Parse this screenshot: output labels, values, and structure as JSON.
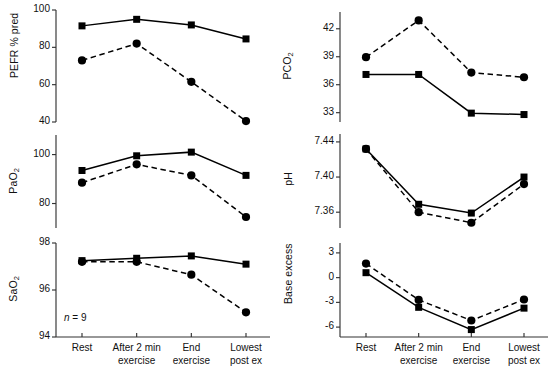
{
  "figure": {
    "annotation_n": "n = 9",
    "categories": [
      "Rest",
      "After 2 min exercise",
      "End exercise",
      "Lowest post ex"
    ],
    "category_lines": [
      [
        "Rest",
        ""
      ],
      [
        "After 2 min",
        "exercise"
      ],
      [
        "End",
        "exercise"
      ],
      [
        "Lowest",
        "post ex"
      ]
    ],
    "series_names": [
      "solid-square-series",
      "dashed-circle-series"
    ],
    "colors": {
      "ink": "#000000",
      "axis": "#333333",
      "background": "#ffffff"
    }
  },
  "chart_data": [
    {
      "type": "line",
      "title": "",
      "ylabel": "PEFR % pred",
      "xlabel": "",
      "categories": [
        "Rest",
        "After 2 min exercise",
        "End exercise",
        "Lowest post ex"
      ],
      "ylim": [
        40,
        100
      ],
      "yticks": [
        40,
        60,
        80,
        100
      ],
      "yticklabels": [
        "40",
        "60",
        "80",
        "100"
      ],
      "grid": false,
      "legend": "none",
      "series": [
        {
          "name": "solid-square-series",
          "style": "solid",
          "marker": "square",
          "values": [
            91.5,
            95.0,
            92.0,
            84.5
          ]
        },
        {
          "name": "dashed-circle-series",
          "style": "dashed",
          "marker": "circle",
          "values": [
            73.0,
            82.0,
            61.5,
            40.5
          ]
        }
      ]
    },
    {
      "type": "line",
      "title": "",
      "ylabel": "PaO2",
      "ylabel_base": "PaO",
      "ylabel_sub": "2",
      "xlabel": "",
      "categories": [
        "Rest",
        "After 2 min exercise",
        "End exercise",
        "Lowest post ex"
      ],
      "ylim": [
        70,
        108
      ],
      "yticks": [
        80,
        100
      ],
      "yticklabels": [
        "80",
        "100"
      ],
      "grid": false,
      "legend": "none",
      "series": [
        {
          "name": "solid-square-series",
          "style": "solid",
          "marker": "square",
          "values": [
            93.5,
            99.5,
            101.0,
            91.5
          ]
        },
        {
          "name": "dashed-circle-series",
          "style": "dashed",
          "marker": "circle",
          "values": [
            88.5,
            96.0,
            91.5,
            74.5
          ]
        }
      ]
    },
    {
      "type": "line",
      "title": "",
      "ylabel": "SaO2",
      "ylabel_base": "SaO",
      "ylabel_sub": "2",
      "xlabel": "",
      "categories": [
        "Rest",
        "After 2 min exercise",
        "End exercise",
        "Lowest post ex"
      ],
      "ylim": [
        94,
        98
      ],
      "yticks": [
        94,
        96,
        98
      ],
      "yticklabels": [
        "94",
        "96",
        "98"
      ],
      "grid": false,
      "legend": "none",
      "series": [
        {
          "name": "solid-square-series",
          "style": "solid",
          "marker": "square",
          "values": [
            97.25,
            97.35,
            97.45,
            97.1
          ]
        },
        {
          "name": "dashed-circle-series",
          "style": "dashed",
          "marker": "circle",
          "values": [
            97.2,
            97.2,
            96.65,
            95.05
          ]
        }
      ]
    },
    {
      "type": "line",
      "title": "",
      "ylabel": "PCO2",
      "ylabel_base": "PCO",
      "ylabel_sub": "2",
      "xlabel": "",
      "categories": [
        "Rest",
        "After 2 min exercise",
        "End exercise",
        "Lowest post ex"
      ],
      "ylim": [
        32,
        43.8
      ],
      "yticks": [
        33,
        36,
        39,
        42
      ],
      "yticklabels": [
        "33",
        "36",
        "39",
        "42"
      ],
      "grid": false,
      "legend": "none",
      "series": [
        {
          "name": "solid-square-series",
          "style": "solid",
          "marker": "square",
          "values": [
            37.1,
            37.1,
            32.95,
            32.8
          ]
        },
        {
          "name": "dashed-circle-series",
          "style": "dashed",
          "marker": "circle",
          "values": [
            38.95,
            42.9,
            37.3,
            36.8
          ]
        }
      ]
    },
    {
      "type": "line",
      "title": "",
      "ylabel": "pH",
      "xlabel": "",
      "categories": [
        "Rest",
        "After 2 min exercise",
        "End exercise",
        "Lowest post ex"
      ],
      "ylim": [
        7.342,
        7.449
      ],
      "yticks": [
        7.36,
        7.4,
        7.44
      ],
      "yticklabels": [
        "7.36",
        "7.40",
        "7.44"
      ],
      "grid": false,
      "legend": "none",
      "series": [
        {
          "name": "solid-square-series",
          "style": "solid",
          "marker": "square",
          "values": [
            7.432,
            7.369,
            7.359,
            7.4
          ]
        },
        {
          "name": "dashed-circle-series",
          "style": "dashed",
          "marker": "circle",
          "values": [
            7.432,
            7.36,
            7.348,
            7.392
          ]
        }
      ]
    },
    {
      "type": "line",
      "title": "",
      "ylabel": "Base excess",
      "xlabel": "",
      "categories": [
        "Rest",
        "After 2 min exercise",
        "End exercise",
        "Lowest post ex"
      ],
      "ylim": [
        -7.2,
        4.2
      ],
      "yticks": [
        -6,
        -3,
        0,
        3
      ],
      "yticklabels": [
        "-6",
        "-3",
        "0",
        "3"
      ],
      "grid": false,
      "legend": "none",
      "series": [
        {
          "name": "solid-square-series",
          "style": "solid",
          "marker": "square",
          "values": [
            0.6,
            -3.6,
            -6.3,
            -3.7
          ]
        },
        {
          "name": "dashed-circle-series",
          "style": "dashed",
          "marker": "circle",
          "values": [
            1.7,
            -2.7,
            -5.2,
            -2.65
          ]
        }
      ]
    }
  ]
}
